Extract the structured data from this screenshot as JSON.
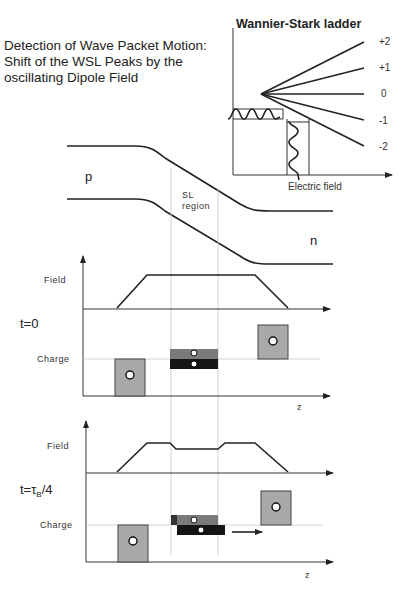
{
  "title": {
    "line1": "Detection of Wave Packet Motion:",
    "line2": "Shift of the WSL Peaks by the",
    "line3": "oscillating Dipole Field"
  },
  "wsl": {
    "title": "Wannier-Stark ladder",
    "levels": [
      "+2",
      "+1",
      "0",
      "-1",
      "-2"
    ],
    "xlabel": "Electric field"
  },
  "band": {
    "p_label": "p",
    "n_label": "n",
    "sl_line1": "SL",
    "sl_line2": "region"
  },
  "panel_t0": {
    "time_label": "t=0",
    "field_label": "Field",
    "charge_label": "Charge",
    "axis_label": "z"
  },
  "panel_t1": {
    "time_prefix": "t=",
    "tau": "τ",
    "tau_sub": "B",
    "time_suffix": "/4",
    "field_label": "Field",
    "charge_label": "Charge",
    "axis_label": "z"
  },
  "colors": {
    "charge_box": "#a9a9a9",
    "positive_layer": "#7a7a7a",
    "negative_layer": "#151515"
  }
}
